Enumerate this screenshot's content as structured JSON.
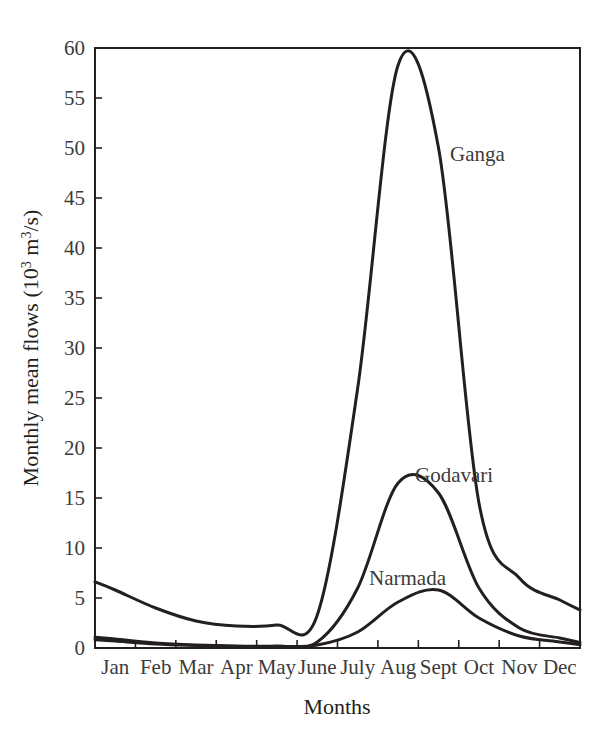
{
  "chart_data": {
    "type": "line",
    "title": "",
    "xlabel": "Months",
    "ylabel": "Monthly mean flows (10^3 m^3/s)",
    "ylabel_parts": {
      "main_before": "Monthly mean flows (10",
      "sup1": "3",
      "mid": " m",
      "sup2": "3",
      "main_after": "/s)"
    },
    "categories": [
      "Jan",
      "Feb",
      "Mar",
      "Apr",
      "May",
      "June",
      "July",
      "Aug",
      "Sept",
      "Oct",
      "Nov",
      "Dec"
    ],
    "ylim": [
      0,
      60
    ],
    "yticks": [
      0,
      5,
      10,
      15,
      20,
      25,
      30,
      35,
      40,
      45,
      50,
      55,
      60
    ],
    "ytick_labels": [
      "0",
      "5",
      "10",
      "15",
      "20",
      "25",
      "30",
      "35",
      "40",
      "45",
      "50",
      "55",
      "60"
    ],
    "grid": false,
    "legend_position": "inline-annotations",
    "line_color": "#231f20",
    "series": [
      {
        "name": "Ganga",
        "label_x_category": "Sept",
        "values": [
          5.8,
          4.0,
          2.7,
          2.2,
          2.3,
          3.3,
          26.0,
          58.3,
          50.0,
          14.5,
          7.0,
          4.8
        ]
      },
      {
        "name": "Godavari",
        "label_x_category": "Sept",
        "values": [
          0.9,
          0.5,
          0.3,
          0.2,
          0.2,
          0.6,
          6.0,
          16.5,
          15.5,
          6.0,
          2.0,
          1.0
        ]
      },
      {
        "name": "Narmada",
        "label_x_category": "Aug",
        "values": [
          0.7,
          0.4,
          0.25,
          0.15,
          0.15,
          0.3,
          1.6,
          4.6,
          5.8,
          3.0,
          1.2,
          0.6
        ]
      }
    ],
    "annotations": [
      {
        "text": "Ganga",
        "x_px": 450,
        "y_px": 161
      },
      {
        "text": "Godavari",
        "x_px": 415,
        "y_px": 482
      },
      {
        "text": "Narmada",
        "x_px": 369,
        "y_px": 585
      }
    ]
  }
}
